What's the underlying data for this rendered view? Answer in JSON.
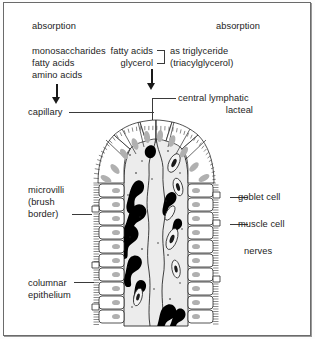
{
  "figure": {
    "type": "biology-diagram",
    "background_color": "#ffffff",
    "ink_color": "#1a1a1a",
    "lumen_color": "#efefef",
    "nucleus_color": "#b3b3b3",
    "capillary_color": "#000000"
  },
  "labels": {
    "absorption_left": "absorption",
    "absorption_right": "absorption",
    "monosaccharides": "monosaccharides",
    "fatty_acids_left": "fatty acids",
    "amino_acids": "amino acids",
    "fatty_acids_right": "fatty acids",
    "glycerol": "glycerol",
    "as_triglyceride": "as triglyceride",
    "triacylglycerol": "(triacylglycerol)",
    "capillary": "capillary",
    "central_lymphatic": "central lymphatic",
    "lacteal": "lacteal",
    "microvilli_line1": "microvilli",
    "microvilli_line2": "(brush",
    "microvilli_line3": "border)",
    "goblet_cell": "goblet cell",
    "muscle_cell": "muscle cell",
    "nerves": "nerves",
    "columnar_line1": "columnar",
    "columnar_line2": "epithelium"
  }
}
